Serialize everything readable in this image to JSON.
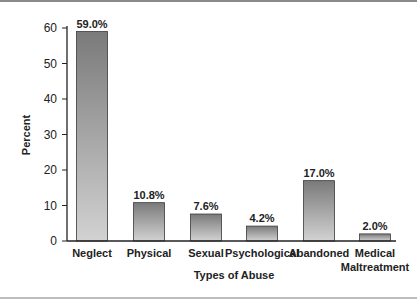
{
  "chart_data": {
    "type": "bar",
    "title": "",
    "xlabel": "Types of Abuse",
    "ylabel": "Percent",
    "ylim": [
      0,
      60
    ],
    "yticks": [
      0,
      10,
      20,
      30,
      40,
      50,
      60
    ],
    "grid": false,
    "legend": null,
    "categories": [
      "Neglect",
      "Physical",
      "Sexual",
      "Psychological",
      "Abandoned",
      "Medical Maltreatment"
    ],
    "category_lines": [
      [
        "Neglect"
      ],
      [
        "Physical"
      ],
      [
        "Sexual"
      ],
      [
        "Psychological"
      ],
      [
        "Abandoned"
      ],
      [
        "Medical",
        "Maltreatment"
      ]
    ],
    "values": [
      59.0,
      10.8,
      7.6,
      4.2,
      17.0,
      2.0
    ],
    "value_labels": [
      "59.0%",
      "10.8%",
      "7.6%",
      "4.2%",
      "17.0%",
      "2.0%"
    ],
    "colors": {
      "bar_top": "#7a7a7a",
      "bar_bottom": "#d2d2d2",
      "bar_edge": "#3a3a3a",
      "axis": "#222222"
    }
  }
}
